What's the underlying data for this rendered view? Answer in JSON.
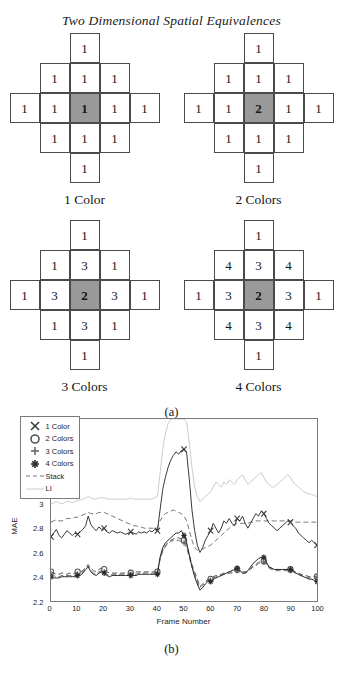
{
  "figure_a": {
    "title": "Two Dimensional Spatial Equivalences",
    "caption": "(a)",
    "diagrams": [
      {
        "label": "1 Color",
        "cells": {
          "r0c2": "1",
          "r1c1": "1",
          "r1c2": "1",
          "r1c3": "1",
          "r2c0": "1",
          "r2c1": "1",
          "r2c2": "1",
          "r2c3": "1",
          "r2c4": "1",
          "r3c1": "1",
          "r3c2": "1",
          "r3c3": "1",
          "r4c2": "1"
        },
        "center_value": "1"
      },
      {
        "label": "2 Colors",
        "cells": {
          "r0c2": "1",
          "r1c1": "1",
          "r1c2": "1",
          "r1c3": "1",
          "r2c0": "1",
          "r2c1": "1",
          "r2c2": "2",
          "r2c3": "1",
          "r2c4": "1",
          "r3c1": "1",
          "r3c2": "1",
          "r3c3": "1",
          "r4c2": "1"
        },
        "center_value": "2"
      },
      {
        "label": "3 Colors",
        "cells": {
          "r0c2": "1",
          "r1c1": "1",
          "r1c2": "3",
          "r1c3": "1",
          "r2c0": "1",
          "r2c1": "3",
          "r2c2": "2",
          "r2c3": "3",
          "r2c4": "1",
          "r3c1": "1",
          "r3c2": "3",
          "r3c3": "1",
          "r4c2": "1"
        },
        "center_value": "2"
      },
      {
        "label": "4 Colors",
        "cells": {
          "r0c2": "1",
          "r1c1": "4",
          "r1c2": "3",
          "r1c3": "4",
          "r2c0": "1",
          "r2c1": "3",
          "r2c2": "2",
          "r2c3": "3",
          "r2c4": "1",
          "r3c1": "4",
          "r3c2": "3",
          "r3c3": "4",
          "r4c2": "1"
        },
        "center_value": "2"
      }
    ],
    "shade_color": "#999999"
  },
  "figure_b": {
    "caption": "(b)"
  },
  "chart_data": {
    "type": "line",
    "title": "",
    "xlabel": "Frame Number",
    "ylabel": "MAE",
    "xlim": [
      0,
      100
    ],
    "ylim": [
      2.2,
      3.7
    ],
    "xticks": [
      0,
      10,
      20,
      30,
      40,
      50,
      60,
      70,
      80,
      90,
      100
    ],
    "yticks": [
      2.2,
      2.4,
      2.6,
      2.8,
      3.0,
      3.2,
      3.4,
      3.6
    ],
    "ytick_labels": [
      "2.2",
      "2.4",
      "2.6",
      "2.8",
      "3",
      "3.2",
      "3.4",
      "3.6"
    ],
    "grid": false,
    "legend_position": "upper-left",
    "legend": [
      {
        "name": "1 Color",
        "marker": "x-marker",
        "linestyle": "solid",
        "color": "#3a3a3a"
      },
      {
        "name": "2 Colors",
        "marker": "circle-marker",
        "linestyle": "dashed",
        "color": "#555555"
      },
      {
        "name": "3 Colors",
        "marker": "plus-marker",
        "linestyle": "dashed",
        "color": "#6a6a6a"
      },
      {
        "name": "4 Colors",
        "marker": "asterisk-marker",
        "linestyle": "solid",
        "color": "#2a2a2a"
      },
      {
        "name": "Stack",
        "marker": "none",
        "linestyle": "dashed",
        "color": "#777777"
      },
      {
        "name": "LI",
        "marker": "none",
        "linestyle": "solid",
        "color": "#cccccc"
      }
    ],
    "x": [
      0,
      1,
      2,
      3,
      4,
      5,
      6,
      7,
      8,
      9,
      10,
      11,
      12,
      13,
      14,
      15,
      16,
      17,
      18,
      19,
      20,
      21,
      22,
      23,
      24,
      25,
      26,
      27,
      28,
      29,
      30,
      31,
      32,
      33,
      34,
      35,
      36,
      37,
      38,
      39,
      40,
      41,
      42,
      43,
      44,
      45,
      46,
      47,
      48,
      49,
      50,
      51,
      52,
      53,
      54,
      55,
      56,
      57,
      58,
      59,
      60,
      61,
      62,
      63,
      64,
      65,
      66,
      67,
      68,
      69,
      70,
      71,
      72,
      73,
      74,
      75,
      76,
      77,
      78,
      79,
      80,
      81,
      82,
      83,
      84,
      85,
      86,
      87,
      88,
      89,
      90,
      91,
      92,
      93,
      94,
      95,
      96,
      97,
      98,
      99,
      100
    ],
    "series": [
      {
        "name": "1 Color",
        "marker_every": 10,
        "values": [
          2.73,
          2.76,
          2.79,
          2.74,
          2.72,
          2.75,
          2.78,
          2.76,
          2.74,
          2.76,
          2.75,
          2.77,
          2.79,
          2.82,
          2.9,
          2.83,
          2.8,
          2.78,
          2.81,
          2.79,
          2.8,
          2.77,
          2.76,
          2.78,
          2.77,
          2.76,
          2.77,
          2.76,
          2.75,
          2.76,
          2.77,
          2.76,
          2.75,
          2.77,
          2.76,
          2.77,
          2.76,
          2.78,
          2.77,
          2.79,
          2.78,
          2.95,
          3.12,
          3.22,
          3.3,
          3.36,
          3.4,
          3.43,
          3.41,
          3.44,
          3.45,
          3.42,
          3.2,
          2.95,
          2.78,
          2.66,
          2.6,
          2.64,
          2.7,
          2.74,
          2.78,
          2.84,
          2.8,
          2.76,
          2.8,
          2.86,
          2.84,
          2.88,
          2.84,
          2.82,
          2.88,
          2.86,
          2.9,
          2.84,
          2.8,
          2.84,
          2.88,
          2.92,
          2.9,
          2.94,
          2.92,
          2.88,
          2.84,
          2.82,
          2.8,
          2.78,
          2.8,
          2.82,
          2.84,
          2.86,
          2.85,
          2.82,
          2.8,
          2.76,
          2.74,
          2.72,
          2.7,
          2.68,
          2.7,
          2.68,
          2.66
        ]
      },
      {
        "name": "2 Colors",
        "marker_every": 10,
        "values": [
          2.44,
          2.43,
          2.42,
          2.42,
          2.43,
          2.43,
          2.42,
          2.43,
          2.42,
          2.43,
          2.44,
          2.44,
          2.45,
          2.48,
          2.5,
          2.47,
          2.45,
          2.44,
          2.46,
          2.47,
          2.46,
          2.44,
          2.43,
          2.43,
          2.43,
          2.43,
          2.43,
          2.43,
          2.43,
          2.43,
          2.43,
          2.43,
          2.44,
          2.44,
          2.44,
          2.44,
          2.44,
          2.44,
          2.44,
          2.44,
          2.44,
          2.55,
          2.62,
          2.66,
          2.68,
          2.7,
          2.71,
          2.72,
          2.72,
          2.71,
          2.7,
          2.66,
          2.58,
          2.5,
          2.44,
          2.38,
          2.32,
          2.34,
          2.36,
          2.38,
          2.38,
          2.4,
          2.41,
          2.41,
          2.42,
          2.43,
          2.43,
          2.44,
          2.44,
          2.45,
          2.46,
          2.45,
          2.44,
          2.44,
          2.45,
          2.47,
          2.49,
          2.5,
          2.52,
          2.53,
          2.53,
          2.51,
          2.48,
          2.47,
          2.46,
          2.46,
          2.46,
          2.46,
          2.46,
          2.46,
          2.46,
          2.45,
          2.44,
          2.43,
          2.42,
          2.41,
          2.41,
          2.4,
          2.4,
          2.4,
          2.4
        ]
      },
      {
        "name": "3 Colors",
        "marker_every": 10,
        "values": [
          2.42,
          2.41,
          2.4,
          2.4,
          2.41,
          2.41,
          2.41,
          2.41,
          2.41,
          2.41,
          2.42,
          2.42,
          2.44,
          2.47,
          2.49,
          2.45,
          2.43,
          2.42,
          2.44,
          2.45,
          2.44,
          2.42,
          2.41,
          2.42,
          2.42,
          2.42,
          2.42,
          2.42,
          2.42,
          2.42,
          2.42,
          2.42,
          2.42,
          2.43,
          2.43,
          2.43,
          2.43,
          2.43,
          2.43,
          2.43,
          2.43,
          2.54,
          2.61,
          2.65,
          2.67,
          2.69,
          2.7,
          2.7,
          2.7,
          2.69,
          2.68,
          2.64,
          2.56,
          2.48,
          2.42,
          2.36,
          2.31,
          2.33,
          2.35,
          2.37,
          2.37,
          2.39,
          2.4,
          2.4,
          2.41,
          2.42,
          2.42,
          2.43,
          2.43,
          2.44,
          2.45,
          2.44,
          2.43,
          2.43,
          2.44,
          2.46,
          2.48,
          2.49,
          2.51,
          2.52,
          2.52,
          2.5,
          2.47,
          2.46,
          2.45,
          2.45,
          2.45,
          2.45,
          2.45,
          2.45,
          2.45,
          2.44,
          2.43,
          2.42,
          2.41,
          2.4,
          2.4,
          2.39,
          2.39,
          2.39,
          2.39
        ]
      },
      {
        "name": "4 Colors",
        "marker_every": 10,
        "values": [
          2.4,
          2.39,
          2.39,
          2.39,
          2.4,
          2.4,
          2.4,
          2.4,
          2.4,
          2.4,
          2.41,
          2.41,
          2.43,
          2.46,
          2.48,
          2.44,
          2.42,
          2.41,
          2.43,
          2.44,
          2.43,
          2.41,
          2.4,
          2.41,
          2.41,
          2.41,
          2.41,
          2.41,
          2.41,
          2.41,
          2.41,
          2.41,
          2.41,
          2.42,
          2.42,
          2.42,
          2.42,
          2.42,
          2.42,
          2.42,
          2.42,
          2.56,
          2.64,
          2.68,
          2.7,
          2.72,
          2.74,
          2.76,
          2.76,
          2.78,
          2.74,
          2.68,
          2.58,
          2.48,
          2.4,
          2.34,
          2.29,
          2.31,
          2.34,
          2.36,
          2.36,
          2.38,
          2.39,
          2.4,
          2.41,
          2.42,
          2.43,
          2.44,
          2.45,
          2.46,
          2.47,
          2.45,
          2.43,
          2.43,
          2.45,
          2.48,
          2.51,
          2.53,
          2.55,
          2.56,
          2.56,
          2.52,
          2.48,
          2.47,
          2.46,
          2.46,
          2.46,
          2.46,
          2.46,
          2.46,
          2.46,
          2.45,
          2.43,
          2.42,
          2.41,
          2.4,
          2.39,
          2.38,
          2.38,
          2.37,
          2.36
        ]
      },
      {
        "name": "Stack",
        "marker_every": 0,
        "values": [
          2.85,
          2.86,
          2.87,
          2.86,
          2.86,
          2.87,
          2.88,
          2.88,
          2.88,
          2.89,
          2.89,
          2.9,
          2.91,
          2.92,
          2.93,
          2.92,
          2.92,
          2.92,
          2.93,
          2.93,
          2.93,
          2.92,
          2.91,
          2.9,
          2.89,
          2.88,
          2.87,
          2.86,
          2.85,
          2.84,
          2.83,
          2.82,
          2.82,
          2.81,
          2.81,
          2.8,
          2.8,
          2.8,
          2.8,
          2.8,
          2.8,
          2.86,
          2.9,
          2.92,
          2.93,
          2.94,
          2.95,
          2.94,
          2.93,
          2.92,
          2.9,
          2.86,
          2.78,
          2.7,
          2.64,
          2.62,
          2.62,
          2.63,
          2.64,
          2.65,
          2.66,
          2.68,
          2.7,
          2.72,
          2.74,
          2.76,
          2.78,
          2.8,
          2.82,
          2.83,
          2.84,
          2.84,
          2.84,
          2.84,
          2.84,
          2.85,
          2.85,
          2.86,
          2.86,
          2.86,
          2.86,
          2.86,
          2.86,
          2.86,
          2.86,
          2.86,
          2.86,
          2.86,
          2.86,
          2.86,
          2.86,
          2.86,
          2.85,
          2.85,
          2.85,
          2.85,
          2.85,
          2.85,
          2.85,
          2.85,
          2.85
        ]
      },
      {
        "name": "LI",
        "marker_every": 0,
        "values": [
          3.0,
          3.01,
          3.02,
          3.01,
          3.0,
          3.01,
          3.02,
          3.02,
          3.01,
          3.02,
          3.03,
          3.03,
          3.04,
          3.05,
          3.06,
          3.05,
          3.04,
          3.04,
          3.05,
          3.05,
          3.05,
          3.04,
          3.04,
          3.04,
          3.04,
          3.04,
          3.04,
          3.04,
          3.04,
          3.04,
          3.05,
          3.04,
          3.04,
          3.04,
          3.04,
          3.04,
          3.04,
          3.04,
          3.04,
          3.05,
          3.06,
          3.25,
          3.45,
          3.58,
          3.66,
          3.7,
          3.7,
          3.7,
          3.7,
          3.7,
          3.7,
          3.68,
          3.5,
          3.3,
          3.14,
          3.06,
          3.02,
          3.04,
          3.06,
          3.08,
          3.1,
          3.14,
          3.18,
          3.16,
          3.14,
          3.18,
          3.16,
          3.2,
          3.18,
          3.16,
          3.2,
          3.22,
          3.24,
          3.2,
          3.16,
          3.18,
          3.2,
          3.22,
          3.24,
          3.26,
          3.22,
          3.18,
          3.16,
          3.14,
          3.14,
          3.16,
          3.18,
          3.2,
          3.22,
          3.24,
          3.22,
          3.18,
          3.16,
          3.14,
          3.12,
          3.1,
          3.09,
          3.08,
          3.08,
          3.07,
          3.06
        ]
      }
    ]
  }
}
